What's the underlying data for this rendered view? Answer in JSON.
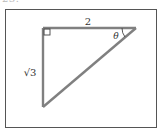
{
  "problem": {
    "number_label": "23."
  },
  "diagram": {
    "type": "right-triangle",
    "frame": {
      "x": 5,
      "y": 9,
      "width": 152,
      "height": 119,
      "stroke": "#555555"
    },
    "vertices": {
      "right_angle": [
        43,
        28
      ],
      "top_right": [
        136,
        28
      ],
      "bottom": [
        43,
        107
      ]
    },
    "side_color": "#808080",
    "labels": {
      "top_side": "2",
      "left_side": "√3",
      "angle": "θ"
    },
    "right_angle_marker": true,
    "angle_arc_at": "top_right"
  }
}
